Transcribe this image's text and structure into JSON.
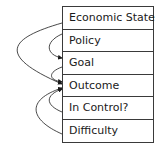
{
  "diagram": {
    "rows": [
      {
        "label": "Economic State"
      },
      {
        "label": "Policy"
      },
      {
        "label": "Goal"
      },
      {
        "label": "Outcome"
      },
      {
        "label": "In Control?"
      },
      {
        "label": "Difficulty"
      }
    ],
    "arrows": [
      {
        "from": "Economic State",
        "to": "Outcome"
      },
      {
        "from": "Policy",
        "to": "Goal"
      },
      {
        "from": "Goal",
        "to": "Outcome"
      },
      {
        "from": "In Control?",
        "to": "Outcome"
      },
      {
        "from": "Difficulty",
        "to": "Outcome"
      }
    ]
  }
}
